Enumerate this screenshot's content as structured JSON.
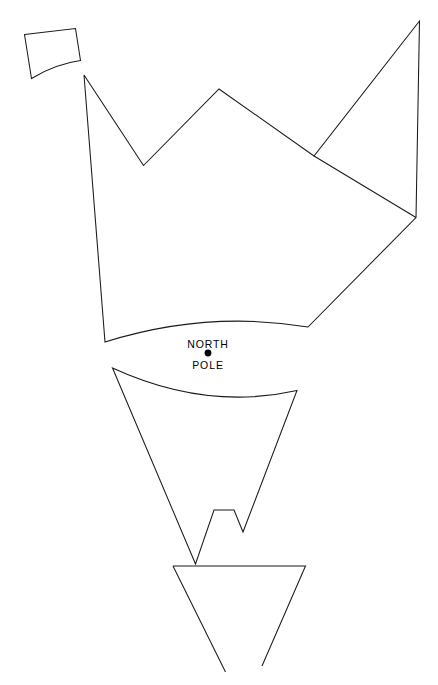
{
  "figure": {
    "kind": "line-drawing-map",
    "width": 438,
    "height": 685,
    "background_color": "#ffffff",
    "stroke_color": "#1a1a1a",
    "label_color": "#000000"
  },
  "labels": {
    "north": "NORTH",
    "pole": "POLE"
  },
  "pole_marker": {
    "cx": 208,
    "cy": 353,
    "r": 3.4,
    "color": "#000000"
  },
  "label_positions": {
    "north_x": 208,
    "north_y": 348,
    "pole_x": 208,
    "pole_y": 369
  },
  "shapes": [
    {
      "name": "small-quadrilateral-fragment",
      "d": "M 24.5 34.5 L 75.5 28.5 L 80.5 60.5 Q 55 64 31.5 78.5 Z"
    },
    {
      "name": "upper-landmass-outline",
      "d": "M 84 75 L 143.5 165.5 L 219 89 L 314 156 L 419.5 21 L 416 217.5 L 308 327 Q 206.5 310 105 342 Z"
    },
    {
      "name": "upper-landmass-inner-ridge",
      "d": "M 314 156 L 416 217.5"
    },
    {
      "name": "lower-landmass-outline",
      "d": "M 112.5 368 Q 206 411 297 390.5 L 243 532 L 234 510 L 214 510 L 195.5 564 Z"
    },
    {
      "name": "bottom-triangle-fragment",
      "d": "M 173 566 L 305.5 566 L 262 666"
    },
    {
      "name": "bottom-triangle-left-edge",
      "d": "M 173 566 L 225.5 672"
    }
  ]
}
